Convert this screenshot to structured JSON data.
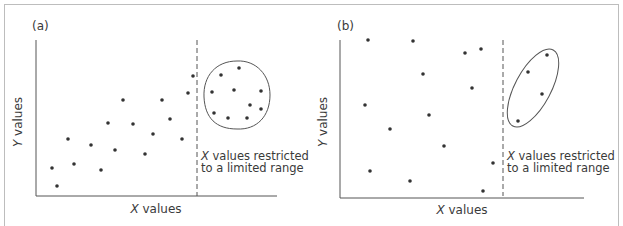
{
  "figure": {
    "panels": [
      {
        "id": "a",
        "label": "(a)",
        "xlabel_italic": "X",
        "xlabel_rest": " values",
        "ylabel_italic": "Y",
        "ylabel_rest": " values",
        "annotation_line1_italic": "X",
        "annotation_line1_rest": " values restricted",
        "annotation_line2": "to a limited range"
      },
      {
        "id": "b",
        "label": "(b)",
        "xlabel_italic": "X",
        "xlabel_rest": " values",
        "ylabel_italic": "Y",
        "ylabel_rest": " values",
        "annotation_line1_italic": "X",
        "annotation_line1_rest": " values restricted",
        "annotation_line2": "to a limited range"
      }
    ]
  },
  "chart_data": [
    {
      "type": "scatter",
      "title": "(a)",
      "xlabel": "X values",
      "ylabel": "Y values",
      "annotation": "X values restricted to a limited range",
      "grid": false,
      "description": "Positive linear trend across full X range; restricted-range subset (circled) shows no correlation",
      "points_full_range": [
        [
          52,
          168
        ],
        [
          57,
          186
        ],
        [
          68,
          139
        ],
        [
          74,
          164
        ],
        [
          91,
          145
        ],
        [
          101,
          170
        ],
        [
          108,
          123
        ],
        [
          115,
          150
        ],
        [
          123,
          100
        ],
        [
          133,
          124
        ],
        [
          145,
          154
        ],
        [
          153,
          134
        ],
        [
          162,
          100
        ],
        [
          170,
          119
        ],
        [
          182,
          139
        ],
        [
          188,
          93
        ],
        [
          193,
          76
        ]
      ],
      "points_restricted_range": [
        [
          221,
          75
        ],
        [
          239,
          68
        ],
        [
          212,
          92
        ],
        [
          234,
          90
        ],
        [
          261,
          91
        ],
        [
          250,
          105
        ],
        [
          261,
          109
        ],
        [
          214,
          113
        ],
        [
          228,
          118
        ],
        [
          247,
          118
        ]
      ],
      "restriction_shape": "circle"
    },
    {
      "type": "scatter",
      "title": "(b)",
      "xlabel": "X values",
      "ylabel": "Y values",
      "annotation": "X values restricted to a limited range",
      "grid": false,
      "description": "No correlation across full X range; restricted-range subset (circled) shows positive correlation",
      "points_full_range": [
        [
          368,
          40
        ],
        [
          413,
          41
        ],
        [
          465,
          53
        ],
        [
          481,
          49
        ],
        [
          423,
          74
        ],
        [
          472,
          88
        ],
        [
          365,
          105
        ],
        [
          429,
          115
        ],
        [
          390,
          129
        ],
        [
          444,
          146
        ],
        [
          493,
          163
        ],
        [
          370,
          171
        ],
        [
          410,
          181
        ],
        [
          483,
          191
        ]
      ],
      "points_restricted_range": [
        [
          547,
          55
        ],
        [
          528,
          72
        ],
        [
          542,
          94
        ],
        [
          518,
          121
        ]
      ],
      "restriction_shape": "ellipse"
    }
  ]
}
